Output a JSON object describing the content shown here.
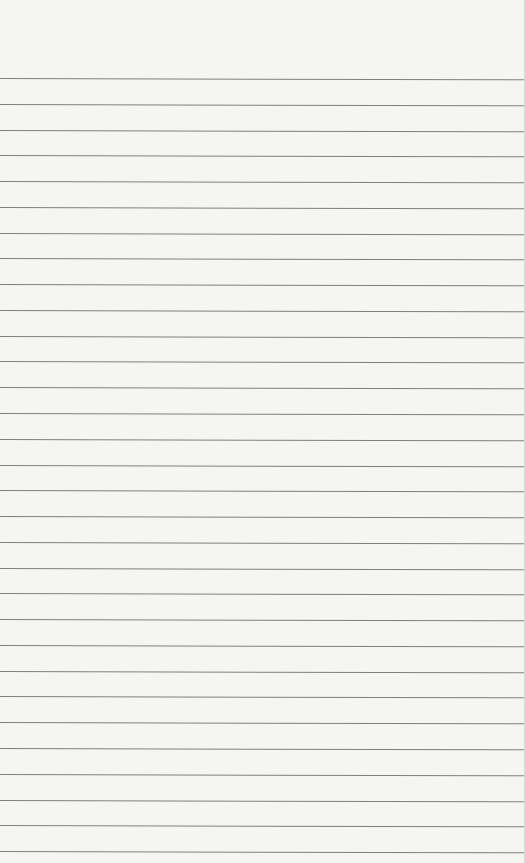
{
  "paper": {
    "type": "lined-paper",
    "background_color": "#f5f5f3",
    "line_color": "#7f7f7f",
    "line_count": 31,
    "first_line_y": 78,
    "line_spacing": 25.77,
    "text": ""
  }
}
